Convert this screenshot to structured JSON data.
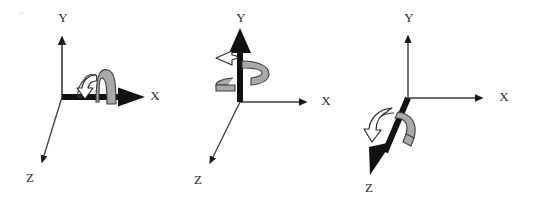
{
  "figure": {
    "caption_present": false,
    "background_color": "#ffffff",
    "panel_count": 3,
    "ink_color": "#1a1a1a",
    "ribbon_fill": "#a9a9a9",
    "ribbon_stroke": "#3a3a3a",
    "arrowhead_hollow_fill": "#ffffff",
    "thin_axis_color": "#4a4a4a"
  },
  "panels": [
    {
      "id": "rot-x",
      "name": "rotation-about-x-axis",
      "emphasized_axis": "X",
      "rotation_sense": "counterclockwise-looking-down-positive-x",
      "axes": [
        {
          "key": "y",
          "label": "Y",
          "label_x": 63,
          "label_y": 22,
          "emphasized": false
        },
        {
          "key": "x",
          "label": "X",
          "label_x": 155,
          "label_y": 100,
          "emphasized": true
        },
        {
          "key": "z",
          "label": "Z",
          "label_x": 30,
          "label_y": 182,
          "emphasized": false
        }
      ]
    },
    {
      "id": "rot-y",
      "name": "rotation-about-y-axis",
      "emphasized_axis": "Y",
      "rotation_sense": "counterclockwise-looking-down-positive-y",
      "axes": [
        {
          "key": "y",
          "label": "Y",
          "label_x": 63,
          "label_y": 22,
          "emphasized": true
        },
        {
          "key": "x",
          "label": "X",
          "label_x": 155,
          "label_y": 100,
          "emphasized": false
        },
        {
          "key": "z",
          "label": "Z",
          "label_x": 30,
          "label_y": 182,
          "emphasized": false
        }
      ]
    },
    {
      "id": "rot-z",
      "name": "rotation-about-z-axis",
      "emphasized_axis": "Z",
      "rotation_sense": "counterclockwise-looking-down-positive-z",
      "axes": [
        {
          "key": "y",
          "label": "Y",
          "label_x": 63,
          "label_y": 22,
          "emphasized": false
        },
        {
          "key": "x",
          "label": "X",
          "label_x": 155,
          "label_y": 100,
          "emphasized": false
        },
        {
          "key": "z",
          "label": "Z",
          "label_x": 30,
          "label_y": 182,
          "emphasized": true
        }
      ]
    }
  ]
}
